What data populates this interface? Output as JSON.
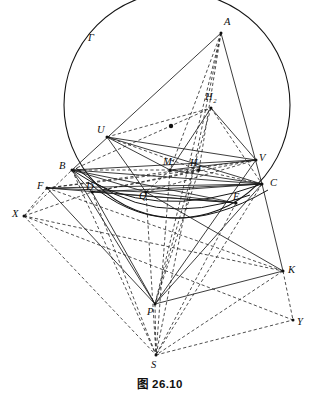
{
  "figure": {
    "caption": "图 26.10",
    "kind": "euclidean-geometry-construction",
    "canvas": {
      "width": 320,
      "height": 402
    },
    "circle": {
      "name": "Gamma",
      "label": "Γ",
      "label_x": 88,
      "label_y": 41,
      "cx": 177,
      "cy": 105,
      "r": 113
    },
    "center_dot": {
      "x": 171,
      "y": 126,
      "r": 2.2
    },
    "points": [
      {
        "id": "A",
        "label": "A",
        "x": 221,
        "y": 33,
        "lx": 224,
        "ly": 25,
        "dot": true
      },
      {
        "id": "B",
        "label": "B",
        "x": 72,
        "y": 170,
        "lx": 59,
        "ly": 169,
        "dot": true
      },
      {
        "id": "C",
        "label": "C",
        "x": 262,
        "y": 184,
        "lx": 270,
        "ly": 186,
        "dot": true
      },
      {
        "id": "U",
        "label": "U",
        "x": 107,
        "y": 137,
        "lx": 97,
        "ly": 133,
        "dot": true
      },
      {
        "id": "V",
        "label": "V",
        "x": 256,
        "y": 160,
        "lx": 259,
        "ly": 161,
        "dot": true
      },
      {
        "id": "M",
        "label": "M",
        "x": 170,
        "y": 170,
        "lx": 163,
        "ly": 165,
        "dot": true
      },
      {
        "id": "H2",
        "label": "H",
        "sub": "2",
        "x": 211,
        "y": 108,
        "lx": 205,
        "ly": 100,
        "dot": true
      },
      {
        "id": "H1",
        "label": "H",
        "sub": "1",
        "x": 199,
        "y": 170,
        "lx": 190,
        "ly": 166,
        "dot": true
      },
      {
        "id": "D",
        "label": "D",
        "x": 92,
        "y": 192,
        "lx": 86,
        "ly": 190,
        "dot": true
      },
      {
        "id": "F",
        "label": "F",
        "x": 47,
        "y": 188,
        "lx": 37,
        "ly": 189,
        "dot": true
      },
      {
        "id": "Q",
        "label": "Q",
        "x": 146,
        "y": 192,
        "lx": 139,
        "ly": 199,
        "dot": true
      },
      {
        "id": "E",
        "label": "E",
        "x": 236,
        "y": 203,
        "lx": 233,
        "ly": 200,
        "dot": true
      },
      {
        "id": "X",
        "label": "X",
        "x": 24,
        "y": 216,
        "lx": 12,
        "ly": 217,
        "dot": true
      },
      {
        "id": "K",
        "label": "K",
        "x": 283,
        "y": 271,
        "lx": 288,
        "ly": 273,
        "dot": true
      },
      {
        "id": "P",
        "label": "P",
        "x": 155,
        "y": 304,
        "lx": 147,
        "ly": 315,
        "dot": true
      },
      {
        "id": "Y",
        "label": "Y",
        "x": 293,
        "y": 320,
        "lx": 297,
        "ly": 325,
        "dot": true
      },
      {
        "id": "S",
        "label": "S",
        "x": 156,
        "y": 355,
        "lx": 151,
        "ly": 368,
        "dot": true
      }
    ],
    "solid_segments": [
      [
        "A",
        "B"
      ],
      [
        "A",
        "C"
      ],
      [
        "B",
        "C"
      ],
      [
        "U",
        "V"
      ],
      [
        "B",
        "V"
      ],
      [
        "U",
        "C"
      ],
      [
        "U",
        "M"
      ],
      [
        "M",
        "V"
      ],
      [
        "M",
        "H2"
      ],
      [
        "H2",
        "V"
      ],
      [
        "B",
        "D"
      ],
      [
        "D",
        "C"
      ],
      [
        "F",
        "C"
      ],
      [
        "F",
        "Q"
      ],
      [
        "B",
        "Q"
      ],
      [
        "Q",
        "C"
      ],
      [
        "B",
        "E"
      ],
      [
        "D",
        "E"
      ],
      [
        "F",
        "E"
      ],
      [
        "Q",
        "E"
      ],
      [
        "B",
        "P"
      ],
      [
        "F",
        "P"
      ],
      [
        "P",
        "K"
      ],
      [
        "P",
        "C"
      ],
      [
        "C",
        "K"
      ],
      [
        "Q",
        "K"
      ],
      [
        "D",
        "P"
      ],
      [
        "P",
        "V"
      ],
      [
        "M",
        "C"
      ],
      [
        "U",
        "Q"
      ]
    ],
    "dashed_segments": [
      [
        "A",
        "P"
      ],
      [
        "A",
        "S"
      ],
      [
        "B",
        "S"
      ],
      [
        "C",
        "S"
      ],
      [
        "P",
        "S"
      ],
      [
        "Q",
        "S"
      ],
      [
        "X",
        "S"
      ],
      [
        "K",
        "S"
      ],
      [
        "X",
        "Y"
      ],
      [
        "K",
        "Y"
      ],
      [
        "S",
        "Y"
      ],
      [
        "X",
        "F"
      ],
      [
        "X",
        "B"
      ],
      [
        "X",
        "D"
      ],
      [
        "X",
        "K"
      ],
      [
        "F",
        "K"
      ],
      [
        "F",
        "V"
      ],
      [
        "D",
        "V"
      ],
      [
        "B",
        "H1"
      ],
      [
        "U",
        "H1"
      ],
      [
        "U",
        "H2"
      ],
      [
        "B",
        "H2"
      ],
      [
        "A",
        "M"
      ],
      [
        "A",
        "H1"
      ],
      [
        "H1",
        "C"
      ],
      [
        "H2",
        "C"
      ],
      [
        "M",
        "Q"
      ],
      [
        "Q",
        "V"
      ],
      [
        "D",
        "H1"
      ],
      [
        "F",
        "H1"
      ],
      [
        "M",
        "S"
      ],
      [
        "E",
        "S"
      ],
      [
        "D",
        "S"
      ],
      [
        "H1",
        "P"
      ],
      [
        "H2",
        "P"
      ]
    ],
    "arcs": [
      {
        "name": "inner-arc-upper",
        "d": "M 72,170 Q 150,225 262,184"
      },
      {
        "name": "inner-arc-lower",
        "d": "M 88,182 Q 165,250 268,190"
      },
      {
        "name": "arc-through-D-E",
        "d": "M 76,168 Q 150,233 250,195"
      }
    ]
  }
}
